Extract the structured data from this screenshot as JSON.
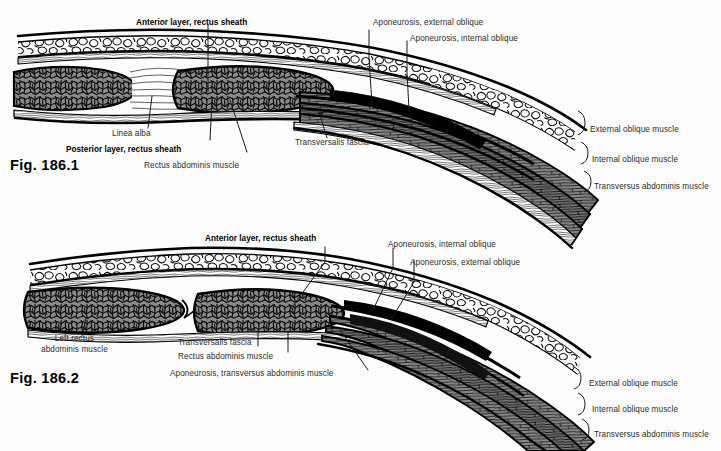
{
  "page": {
    "background_color": "#fdfdfd",
    "width": 721,
    "height": 451
  },
  "palette": {
    "ink": "#000000",
    "muscle_gray": "#8a8a8a",
    "muscle_gray_dark": "#6f6f6f",
    "fat_white": "#ffffff",
    "label_text": "#2b2b2b",
    "leader_line": "#1a1a1a"
  },
  "figures": [
    {
      "id": "fig-186-1",
      "caption": "Fig. 186.1",
      "labels": [
        {
          "name": "anterior-layer-rectus-sheath",
          "text": "Anterior layer, rectus sheath",
          "bold": true
        },
        {
          "name": "aponeurosis-external-oblique",
          "text": "Aponeurosis, external oblique",
          "bold": false
        },
        {
          "name": "aponeurosis-internal-oblique",
          "text": "Aponeurosis, internal oblique",
          "bold": false
        },
        {
          "name": "linea-alba",
          "text": "Linea alba",
          "bold": false
        },
        {
          "name": "posterior-layer-rectus-sheath",
          "text": "Posterior layer, rectus sheath",
          "bold": true
        },
        {
          "name": "rectus-abdominis-muscle",
          "text": "Rectus abdominis muscle",
          "bold": false
        },
        {
          "name": "transversalis-fascia",
          "text": "Transversalis fascia",
          "bold": false
        },
        {
          "name": "external-oblique-muscle",
          "text": "External oblique muscle",
          "bold": false
        },
        {
          "name": "internal-oblique-muscle",
          "text": "Internal oblique muscle",
          "bold": false
        },
        {
          "name": "transversus-abdominis-muscle",
          "text": "Transversus abdominis muscle",
          "bold": false
        }
      ]
    },
    {
      "id": "fig-186-2",
      "caption": "Fig. 186.2",
      "labels": [
        {
          "name": "anterior-layer-rectus-sheath",
          "text": "Anterior layer, rectus sheath",
          "bold": true
        },
        {
          "name": "aponeurosis-internal-oblique",
          "text": "Aponeurosis, internal oblique",
          "bold": false
        },
        {
          "name": "aponeurosis-external-oblique",
          "text": "Aponeurosis, external oblique",
          "bold": false
        },
        {
          "name": "left-rectus-abdominis-muscle",
          "text": "Left rectus\nabdominis muscle",
          "bold": false
        },
        {
          "name": "transversalis-fascia",
          "text": "Transversalis fascia",
          "bold": false
        },
        {
          "name": "rectus-abdominis-muscle",
          "text": "Rectus abdominis muscle",
          "bold": false
        },
        {
          "name": "aponeurosis-transversus-abdominis-muscle",
          "text": "Aponeurosis, transversus abdominis muscle",
          "bold": false
        },
        {
          "name": "external-oblique-muscle",
          "text": "External oblique muscle",
          "bold": false
        },
        {
          "name": "internal-oblique-muscle",
          "text": "Internal oblique muscle",
          "bold": false
        },
        {
          "name": "transversus-abdominis-muscle",
          "text": "Transversus abdominis muscle",
          "bold": false
        }
      ]
    }
  ]
}
